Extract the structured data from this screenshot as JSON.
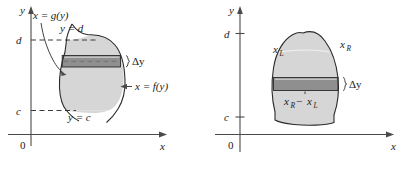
{
  "figure": {
    "type": "math-diagram",
    "background_color": "#ffffff",
    "region_fill_color": "#d6d6d6",
    "strip_fill_color": "#8f8f8f",
    "axis_color": "#4a4a4a",
    "curve_color": "#2b2b2b"
  },
  "left_panel": {
    "name": "region-between-curves-x-of-y",
    "axes": {
      "y_axis_label": "y",
      "x_axis_label": "x",
      "origin_label": "0"
    },
    "ticks": [
      {
        "label": "d",
        "kind": "dashed-guide"
      },
      {
        "label": "c",
        "kind": "dashed-guide"
      }
    ],
    "labels": {
      "left_curve": "x = g(y)",
      "right_curve": "x = f(y)",
      "top_bound": "y = d",
      "bottom_bound": "y = c",
      "strip_thickness": "Δy"
    }
  },
  "right_panel": {
    "name": "region-with-xr-minus-xl",
    "axes": {
      "y_axis_label": "y",
      "x_axis_label": "x",
      "origin_label": "0"
    },
    "ticks": [
      {
        "label": "d",
        "kind": "tick-mark"
      },
      {
        "label": "c",
        "kind": "tick-mark"
      }
    ],
    "labels": {
      "left_boundary": "x",
      "left_boundary_sub": "L",
      "right_boundary": "x",
      "right_boundary_sub": "R",
      "width_expr_first": "x",
      "width_expr_first_sub": "R",
      "width_expr_minus": "−",
      "width_expr_second": "x",
      "width_expr_second_sub": "L",
      "strip_thickness": "Δy"
    }
  }
}
